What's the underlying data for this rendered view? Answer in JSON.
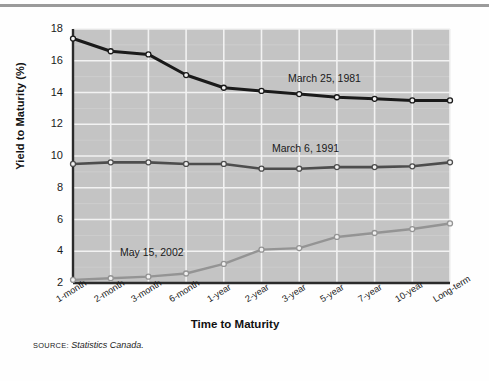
{
  "figure": {
    "source_prefix": "SOURCE:",
    "source_text": "Statistics Canada.",
    "rule_color": "#9a9a9a"
  },
  "chart_data": {
    "type": "line",
    "title": "",
    "xlabel": "Time to Maturity",
    "ylabel": "Yield to Maturity (%)",
    "ylim": [
      2,
      18
    ],
    "yticks": [
      2,
      4,
      6,
      8,
      10,
      12,
      14,
      16,
      18
    ],
    "grid": true,
    "legend_position": "inline-annotation",
    "plot_bg": "#c4c4c4",
    "gridline_color": "#f2f2f2",
    "axis_color": "#2b2b2b",
    "categories": [
      "1-month",
      "2-month",
      "3-month",
      "6-month",
      "1-year",
      "2-year",
      "3-year",
      "5-year",
      "7-year",
      "10-year",
      "Long-term"
    ],
    "series": [
      {
        "name": "March 25, 1981",
        "color": "#1a1a1a",
        "marker": "circle",
        "label_x_category": "3-year",
        "values": [
          17.4,
          16.6,
          16.4,
          15.1,
          14.3,
          14.1,
          13.9,
          13.7,
          13.6,
          13.5,
          13.5
        ]
      },
      {
        "name": "March 6, 1991",
        "color": "#4d4d4d",
        "marker": "circle",
        "label_x_category": "3-year",
        "values": [
          9.5,
          9.6,
          9.6,
          9.5,
          9.5,
          9.2,
          9.2,
          9.3,
          9.3,
          9.35,
          9.6
        ]
      },
      {
        "name": "May 15, 2002",
        "color": "#949494",
        "marker": "circle",
        "label_x_category": "2-month",
        "values": [
          2.2,
          2.3,
          2.4,
          2.6,
          3.2,
          4.1,
          4.2,
          4.9,
          5.15,
          5.4,
          5.75
        ]
      }
    ]
  }
}
